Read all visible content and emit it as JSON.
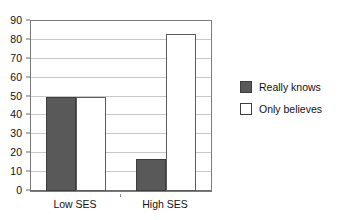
{
  "chart_data": {
    "type": "bar",
    "title": "",
    "subtitle": "",
    "xlabel": "",
    "ylabel": "",
    "categories": [
      "Low SES",
      "High SES"
    ],
    "series": [
      {
        "name": "Really knows",
        "values": [
          50,
          17
        ],
        "color": "#595959"
      },
      {
        "name": "Only believes",
        "values": [
          50,
          83
        ],
        "color": "#ffffff"
      }
    ],
    "ylim": [
      0,
      90
    ],
    "ytick_step": 10,
    "yticks": [
      0,
      10,
      20,
      30,
      40,
      50,
      60,
      70,
      80,
      90
    ],
    "ytick_labels": [
      "0",
      "10",
      "20",
      "30",
      "40",
      "50",
      "60",
      "70",
      "80",
      "90"
    ],
    "grid": true,
    "grid_axis": "y",
    "grid_color": "#c8c8c8",
    "legend": {
      "position": "right",
      "entries": [
        {
          "label": "Really knows",
          "swatch": "filled-gray-square"
        },
        {
          "label": "Only believes",
          "swatch": "outlined-white-square"
        }
      ]
    },
    "frame_color": "#7a7a7a",
    "background": "#ffffff"
  }
}
